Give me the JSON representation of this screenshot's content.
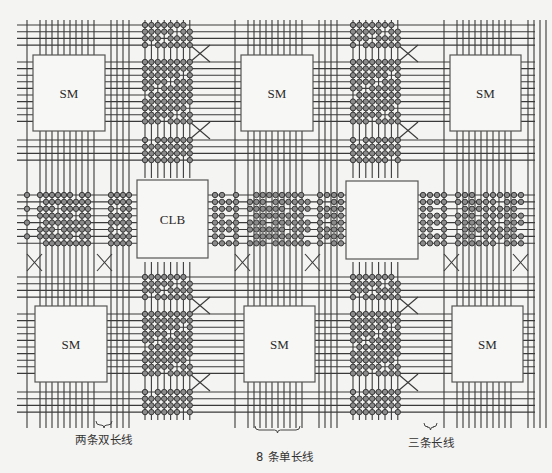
{
  "diagram": {
    "colors": {
      "background": "#f4f4f2",
      "line": "#3a3a3a",
      "box_fill": "#f7f7f5",
      "box_stroke": "#555555",
      "switch_fill": "#8a8a8a",
      "switch_stroke": "#2e2e2e"
    },
    "switch_matrices": [
      {
        "id": "sm-top-left",
        "label": "SM",
        "x": 33,
        "y": 55,
        "w": 72,
        "h": 76
      },
      {
        "id": "sm-top-center",
        "label": "SM",
        "x": 241,
        "y": 55,
        "w": 72,
        "h": 76
      },
      {
        "id": "sm-top-right",
        "label": "SM",
        "x": 450,
        "y": 55,
        "w": 71,
        "h": 76
      },
      {
        "id": "sm-bottom-left",
        "label": "SM",
        "x": 35,
        "y": 306,
        "w": 72,
        "h": 76
      },
      {
        "id": "sm-bottom-center",
        "label": "SM",
        "x": 244,
        "y": 306,
        "w": 71,
        "h": 76
      },
      {
        "id": "sm-bottom-right",
        "label": "SM",
        "x": 452,
        "y": 306,
        "w": 71,
        "h": 76
      }
    ],
    "clbs": [
      {
        "id": "clb-left",
        "label": "CLB",
        "x": 137,
        "y": 180,
        "w": 71,
        "h": 78
      },
      {
        "id": "clb-right",
        "label": "",
        "x": 346,
        "y": 181,
        "w": 72,
        "h": 78
      }
    ],
    "captions": [
      {
        "id": "double-length-lines",
        "text": "两条双长线",
        "x": 75,
        "y": 431,
        "brace": {
          "x1": 96,
          "x2": 112,
          "y": 425
        }
      },
      {
        "id": "single-length-lines",
        "text": "8 条单长线",
        "x": 256,
        "y": 448,
        "brace": {
          "x1": 255,
          "x2": 300,
          "y": 430
        }
      },
      {
        "id": "long-lines",
        "text": "三条长线",
        "x": 408,
        "y": 434,
        "brace": {
          "x1": 424,
          "x2": 437,
          "y": 427
        }
      }
    ]
  }
}
